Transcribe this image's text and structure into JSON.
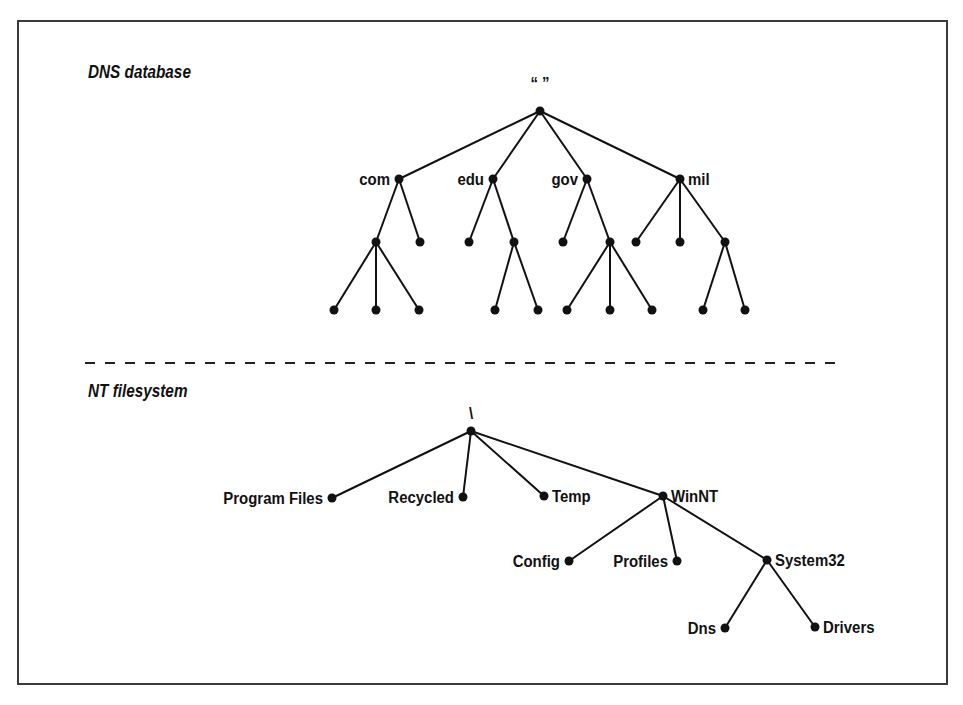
{
  "dns": {
    "title": "DNS database",
    "root_label": "“ ”",
    "nodes": [
      {
        "id": "root",
        "x": 540,
        "y": 111,
        "label": "“ ”",
        "label_pos": "above"
      },
      {
        "id": "com",
        "x": 399,
        "y": 179,
        "label": "com",
        "label_pos": "left"
      },
      {
        "id": "edu",
        "x": 493,
        "y": 179,
        "label": "edu",
        "label_pos": "left"
      },
      {
        "id": "gov",
        "x": 587,
        "y": 179,
        "label": "gov",
        "label_pos": "left"
      },
      {
        "id": "mil",
        "x": 680,
        "y": 179,
        "label": "mil",
        "label_pos": "right"
      },
      {
        "id": "com1",
        "x": 376,
        "y": 242
      },
      {
        "id": "com2",
        "x": 420,
        "y": 242
      },
      {
        "id": "edu1",
        "x": 469,
        "y": 242
      },
      {
        "id": "edu2",
        "x": 514,
        "y": 242
      },
      {
        "id": "gov1",
        "x": 563,
        "y": 242
      },
      {
        "id": "gov2",
        "x": 610,
        "y": 242
      },
      {
        "id": "mil1",
        "x": 636,
        "y": 242
      },
      {
        "id": "mil2",
        "x": 680,
        "y": 242
      },
      {
        "id": "mil3",
        "x": 725,
        "y": 242
      },
      {
        "id": "c1a",
        "x": 334,
        "y": 310
      },
      {
        "id": "c1b",
        "x": 376,
        "y": 310
      },
      {
        "id": "c1c",
        "x": 419,
        "y": 310
      },
      {
        "id": "e2a",
        "x": 495,
        "y": 310
      },
      {
        "id": "e2b",
        "x": 538,
        "y": 310
      },
      {
        "id": "g2a",
        "x": 567,
        "y": 310
      },
      {
        "id": "g2b",
        "x": 610,
        "y": 310
      },
      {
        "id": "g2c",
        "x": 652,
        "y": 310
      },
      {
        "id": "m3a",
        "x": 703,
        "y": 310
      },
      {
        "id": "m3b",
        "x": 745,
        "y": 310
      }
    ],
    "edges": [
      [
        "root",
        "com"
      ],
      [
        "root",
        "edu"
      ],
      [
        "root",
        "gov"
      ],
      [
        "root",
        "mil"
      ],
      [
        "com",
        "com1"
      ],
      [
        "com",
        "com2"
      ],
      [
        "edu",
        "edu1"
      ],
      [
        "edu",
        "edu2"
      ],
      [
        "gov",
        "gov1"
      ],
      [
        "gov",
        "gov2"
      ],
      [
        "mil",
        "mil1"
      ],
      [
        "mil",
        "mil2"
      ],
      [
        "mil",
        "mil3"
      ],
      [
        "com1",
        "c1a"
      ],
      [
        "com1",
        "c1b"
      ],
      [
        "com1",
        "c1c"
      ],
      [
        "edu2",
        "e2a"
      ],
      [
        "edu2",
        "e2b"
      ],
      [
        "gov2",
        "g2a"
      ],
      [
        "gov2",
        "g2b"
      ],
      [
        "gov2",
        "g2c"
      ],
      [
        "mil3",
        "m3a"
      ],
      [
        "mil3",
        "m3b"
      ]
    ]
  },
  "nt": {
    "title": "NT filesystem",
    "root_label": "\\",
    "nodes": [
      {
        "id": "root",
        "x": 471,
        "y": 431,
        "label": "\\",
        "label_pos": "above"
      },
      {
        "id": "progfiles",
        "x": 332,
        "y": 498,
        "label": "Program Files",
        "label_pos": "left"
      },
      {
        "id": "recycled",
        "x": 463,
        "y": 497,
        "label": "Recycled",
        "label_pos": "left"
      },
      {
        "id": "temp",
        "x": 544,
        "y": 496,
        "label": "Temp",
        "label_pos": "right"
      },
      {
        "id": "winnt",
        "x": 663,
        "y": 496,
        "label": "WinNT",
        "label_pos": "right"
      },
      {
        "id": "config",
        "x": 569,
        "y": 561,
        "label": "Config",
        "label_pos": "left"
      },
      {
        "id": "profiles",
        "x": 677,
        "y": 561,
        "label": "Profiles",
        "label_pos": "left"
      },
      {
        "id": "system32",
        "x": 767,
        "y": 560,
        "label": "System32",
        "label_pos": "right"
      },
      {
        "id": "dns",
        "x": 725,
        "y": 628,
        "label": "Dns",
        "label_pos": "left"
      },
      {
        "id": "drivers",
        "x": 815,
        "y": 627,
        "label": "Drivers",
        "label_pos": "right"
      }
    ],
    "edges": [
      [
        "root",
        "progfiles"
      ],
      [
        "root",
        "recycled"
      ],
      [
        "root",
        "temp"
      ],
      [
        "root",
        "winnt"
      ],
      [
        "winnt",
        "config"
      ],
      [
        "winnt",
        "profiles"
      ],
      [
        "winnt",
        "system32"
      ],
      [
        "system32",
        "dns"
      ],
      [
        "system32",
        "drivers"
      ]
    ]
  },
  "divider": {
    "x1": 85,
    "x2": 840,
    "y": 363
  },
  "colors": {
    "ink": "#111111",
    "frame": "#3a3a3a",
    "background": "#ffffff"
  }
}
